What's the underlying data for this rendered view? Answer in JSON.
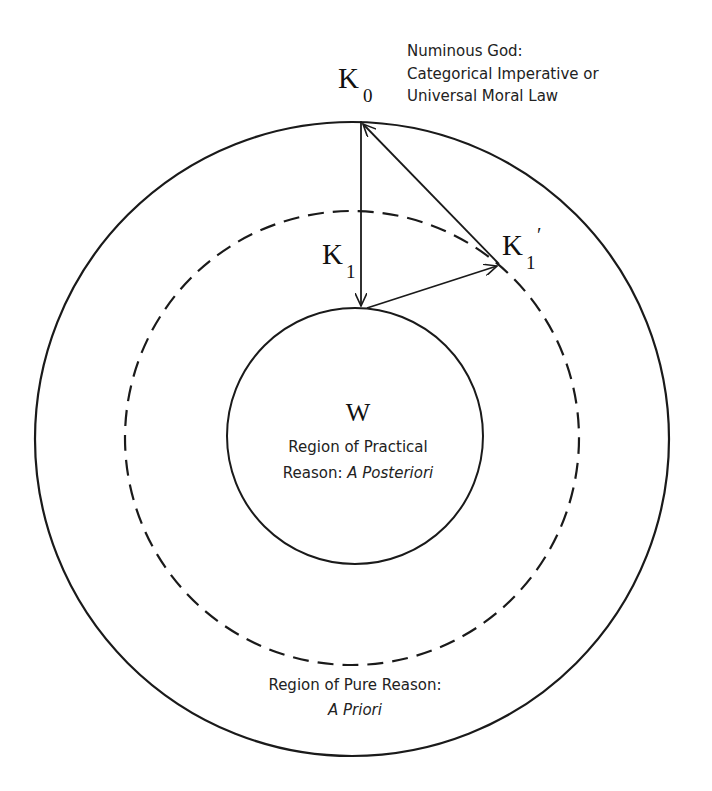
{
  "diagram": {
    "nodes": {
      "k0": {
        "label": "K",
        "sub": "0"
      },
      "k1": {
        "label": "K",
        "sub": "1"
      },
      "k1prime": {
        "label": "K",
        "sub": "1",
        "prime": "′"
      },
      "w": {
        "label": "W"
      }
    },
    "annotations": {
      "god_line1": "Numinous God:",
      "god_line2": "Categorical Imperative or",
      "god_line3": "Universal Moral Law",
      "practical_line1": "Region of Practical",
      "practical_line2_plain": "Reason: ",
      "practical_line2_italic": "A Posteriori",
      "pure_line1": "Region of Pure Reason:",
      "pure_line2_italic": "A Priori"
    },
    "regions": [
      {
        "name": "outer-circle",
        "style": "solid"
      },
      {
        "name": "middle-circle",
        "style": "dashed"
      },
      {
        "name": "inner-circle",
        "style": "solid"
      }
    ],
    "colors": {
      "stroke": "#1a1a1a",
      "background": "#ffffff"
    }
  }
}
